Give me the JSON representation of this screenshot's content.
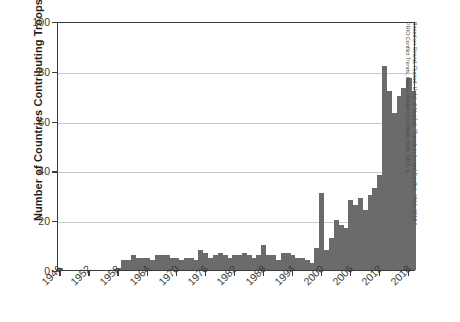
{
  "chart_data": {
    "type": "bar",
    "title": "",
    "xlabel": "",
    "ylabel": "Number of Countries Contributing Troops",
    "ylim": [
      0,
      100
    ],
    "yticks": [
      0,
      20,
      40,
      60,
      80,
      100
    ],
    "xticks": [
      1946,
      1952,
      1958,
      1964,
      1970,
      1976,
      1982,
      1988,
      1994,
      2000,
      2006,
      2012,
      2018
    ],
    "grid": "horizontal",
    "legend": "none",
    "bar_color": "#6b6b6b",
    "axis_color": "#3b3b3b",
    "gridline_color": "#c9c9c9",
    "xlim": [
      1946,
      2019
    ],
    "categories": [
      1946,
      1947,
      1948,
      1949,
      1950,
      1951,
      1952,
      1953,
      1954,
      1955,
      1956,
      1957,
      1958,
      1959,
      1960,
      1961,
      1962,
      1963,
      1964,
      1965,
      1966,
      1967,
      1968,
      1969,
      1970,
      1971,
      1972,
      1973,
      1974,
      1975,
      1976,
      1977,
      1978,
      1979,
      1980,
      1981,
      1982,
      1983,
      1984,
      1985,
      1986,
      1987,
      1988,
      1989,
      1990,
      1991,
      1992,
      1993,
      1994,
      1995,
      1996,
      1997,
      1998,
      1999,
      2000,
      2001,
      2002,
      2003,
      2004,
      2005,
      2006,
      2007,
      2008,
      2009,
      2010,
      2011,
      2012,
      2013,
      2014,
      2015,
      2016,
      2017,
      2018,
      2019
    ],
    "values": [
      1,
      0,
      0,
      0,
      0,
      0,
      0,
      0,
      0,
      0,
      0,
      0,
      1,
      4,
      4,
      6,
      5,
      5,
      5,
      4,
      6,
      6,
      6,
      5,
      5,
      4,
      5,
      5,
      4,
      8,
      7,
      5,
      6,
      7,
      6,
      5,
      6,
      6,
      7,
      6,
      5,
      6,
      10,
      6,
      6,
      4,
      7,
      7,
      6,
      5,
      5,
      4,
      3,
      9,
      31,
      8,
      13,
      20,
      18,
      17,
      28,
      26,
      29,
      24,
      30,
      33,
      38,
      82,
      72,
      63,
      70,
      73,
      77,
      72
    ],
    "annotations": [],
    "source": "Based on Strand, Rustad, Urdal, & Nygård, \"Trends in Armed Conflict, 1946–2018,\" PRIO Conflict Trends, Peace Research Institute Oslo, 2019, 3."
  },
  "axes": {
    "y_title": "Number of Countries Contributing Troops",
    "y_tick_labels": [
      "0",
      "20",
      "40",
      "60",
      "80",
      "100"
    ],
    "x_tick_labels": [
      "1946",
      "1952",
      "1958",
      "1964",
      "1970",
      "1976",
      "1982",
      "1988",
      "1994",
      "2000",
      "2006",
      "2012",
      "2018"
    ]
  },
  "credit": {
    "line1": "Based on Strand, Rustad, Urdal, & Nygård, \"Trends in Armed Conflict, 1946–2018,\"",
    "line2": "PRIO Conflict Trends, Peace Research Institute Oslo, 2019, 3."
  }
}
